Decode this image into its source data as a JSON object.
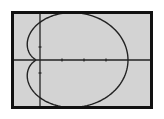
{
  "screen": {
    "background": "#d3d3d3",
    "border_color": "#111111",
    "curve_color": "#222222",
    "axis_color": "#222222"
  },
  "chart_data": {
    "type": "line",
    "subtype": "polar",
    "title": "",
    "xlabel": "",
    "ylabel": "",
    "grid": false,
    "legend": null,
    "xlim": [
      -1.0,
      5.0
    ],
    "ylim": [
      -3.5,
      3.5
    ],
    "x_ticks": [
      1,
      2,
      3
    ],
    "y_ticks": [
      -1,
      1
    ],
    "curve_params": {
      "a": 2.1,
      "b": 1.9
    },
    "key_points": [
      {
        "label": "rightmost",
        "x": 4.0,
        "y": 0
      },
      {
        "label": "left-dimple",
        "x": -0.2,
        "y": 0
      },
      {
        "label": "top",
        "x": 1.3,
        "y": 3.0
      },
      {
        "label": "bottom",
        "x": 1.3,
        "y": -2.9
      },
      {
        "label": "y-intercept-upper",
        "x": 0,
        "y": 2.15
      },
      {
        "label": "y-intercept-lower",
        "x": 0,
        "y": -2.15
      }
    ],
    "pixel_mapping": {
      "origin_x": 26,
      "origin_y": 46,
      "px_per_x_unit": 22,
      "px_per_y_unit": 13
    }
  }
}
